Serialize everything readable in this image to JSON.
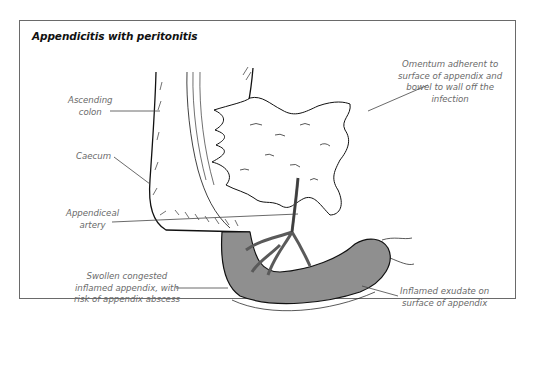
{
  "figure": {
    "title": "Appendicitis with peritonitis",
    "colors": {
      "frame": "#6a6a6a",
      "label_text": "#6a6a6a",
      "appendix_fill": "#8f8f8f",
      "outline": "#111111"
    },
    "labels": [
      {
        "id": "ascending-colon",
        "lines": [
          "Ascending",
          "colon"
        ]
      },
      {
        "id": "omentum",
        "lines": [
          "Omentum adherent to",
          "surface of appendix and",
          "bowel to wall off the",
          "infection"
        ]
      },
      {
        "id": "caecum",
        "lines": [
          "Caecum"
        ]
      },
      {
        "id": "appendiceal-artery",
        "lines": [
          "Appendiceal",
          "artery"
        ]
      },
      {
        "id": "swollen-appendix",
        "lines": [
          "Swollen congested",
          "inflamed appendix, with",
          "risk of appendix abscess"
        ]
      },
      {
        "id": "inflamed-exudate",
        "lines": [
          "Inflamed exudate on",
          "surface of appendix"
        ]
      }
    ]
  }
}
